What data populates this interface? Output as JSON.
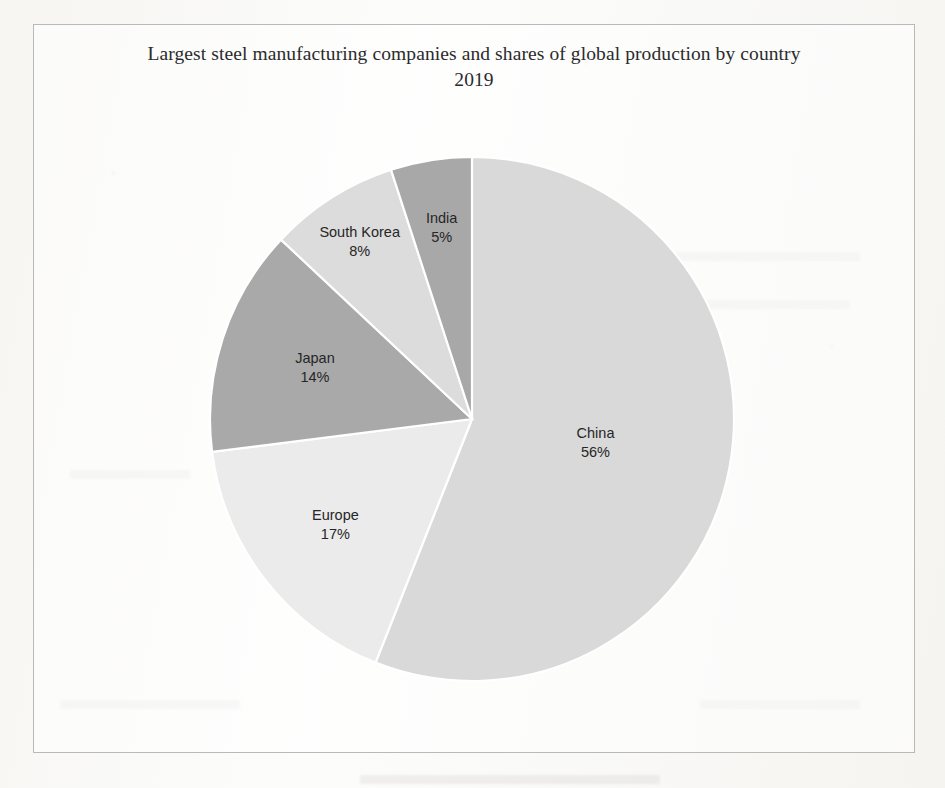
{
  "page": {
    "background_color": "#fcfcfb",
    "frame_border_color": "#b9b9b9"
  },
  "chart": {
    "title": "Largest steel manufacturing companies and shares of global production by country 2019"
  },
  "chart_data": {
    "type": "pie",
    "title": "Largest steel manufacturing companies and shares of global production by country 2019",
    "xlabel": "",
    "ylabel": "",
    "legend": "none",
    "labels_inline": true,
    "start_angle_deg": 0,
    "direction": "clockwise",
    "categories": [
      "China",
      "Europe",
      "Japan",
      "South Korea",
      "India"
    ],
    "values": [
      56,
      17,
      14,
      8,
      5
    ],
    "unit": "%",
    "colors": [
      "#d9d9d9",
      "#ebebeb",
      "#a9a9a9",
      "#dcdcdc",
      "#a8a8a8"
    ],
    "slices": [
      {
        "label": "China",
        "value": 56,
        "value_text": "56%",
        "color": "#d9d9d9"
      },
      {
        "label": "Europe",
        "value": 17,
        "value_text": "17%",
        "color": "#ebebeb"
      },
      {
        "label": "Japan",
        "value": 14,
        "value_text": "14%",
        "color": "#a9a9a9"
      },
      {
        "label": "South Korea",
        "value": 8,
        "value_text": "8%",
        "color": "#dcdcdc"
      },
      {
        "label": "India",
        "value": 5,
        "value_text": "5%",
        "color": "#a8a8a8"
      }
    ]
  }
}
